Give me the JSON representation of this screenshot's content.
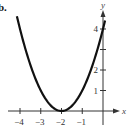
{
  "part_label": "b.",
  "chart_data": {
    "type": "line",
    "title": "",
    "function": "y = (x + 2)^2",
    "xlabel": "x",
    "ylabel": "y",
    "xlim": [
      -4.3,
      0.6
    ],
    "ylim": [
      -0.3,
      4.6
    ],
    "grid": false,
    "x_ticks": [
      -4,
      -3,
      -2,
      -1
    ],
    "x_tick_labels": [
      "−4",
      "−3",
      "−2",
      "−1"
    ],
    "y_ticks": [
      1,
      2,
      3,
      4
    ],
    "y_tick_labels": [
      "1",
      "2",
      "",
      "4"
    ],
    "series": [
      {
        "name": "parabola",
        "x": [
          -4.15,
          -4,
          -3.5,
          -3,
          -2.5,
          -2,
          -1.5,
          -1,
          -0.5,
          0,
          0.1
        ],
        "y": [
          4.62,
          4,
          2.25,
          1,
          0.25,
          0,
          0.25,
          1,
          2.25,
          4,
          4.41
        ]
      }
    ],
    "vertex": [
      -2,
      0
    ]
  }
}
